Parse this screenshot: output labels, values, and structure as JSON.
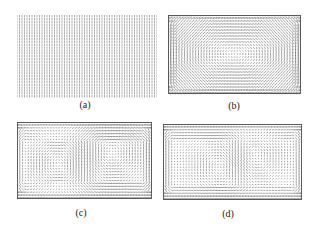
{
  "figure": {
    "panels": [
      {
        "id": "a",
        "label": "(a)",
        "field_type": "uniform-vertical",
        "box": {
          "x": 17,
          "y": 15,
          "w": 140,
          "h": 80
        },
        "label_pos": {
          "x": 85,
          "y": 100
        },
        "grid": {
          "cols": 56,
          "rows": 28
        },
        "stroke": "#555555"
      },
      {
        "id": "b",
        "label": "(b)",
        "field_type": "single-vortex",
        "box": {
          "x": 168,
          "y": 15,
          "w": 133,
          "h": 78
        },
        "label_pos": {
          "x": 234,
          "y": 101
        },
        "grid": {
          "cols": 48,
          "rows": 26
        },
        "stroke": "#333333"
      },
      {
        "id": "c",
        "label": "(c)",
        "field_type": "double-vortex",
        "box": {
          "x": 17,
          "y": 122,
          "w": 135,
          "h": 76
        },
        "label_pos": {
          "x": 81,
          "y": 208
        },
        "grid": {
          "cols": 48,
          "rows": 26
        },
        "stroke": "#333333"
      },
      {
        "id": "d",
        "label": "(d)",
        "field_type": "double-vortex-centered",
        "box": {
          "x": 163,
          "y": 124,
          "w": 139,
          "h": 75
        },
        "label_pos": {
          "x": 228,
          "y": 209
        },
        "grid": {
          "cols": 48,
          "rows": 26
        },
        "stroke": "#333333"
      }
    ]
  }
}
